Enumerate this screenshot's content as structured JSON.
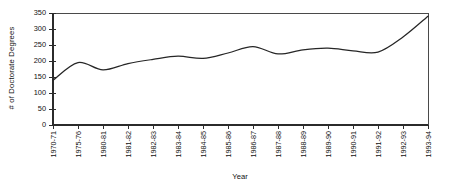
{
  "chart_data": {
    "type": "line",
    "title": "",
    "xlabel": "Year",
    "ylabel": "# of  Doctorate  Degrees",
    "categories": [
      "1970-71",
      "1975-76",
      "1980-81",
      "1981-82",
      "1982-83",
      "1983-84",
      "1984-85",
      "1985-86",
      "1986-87",
      "1987-88",
      "1988-89",
      "1989-90",
      "1990-91",
      "1991-92",
      "1992-93",
      "1993-94"
    ],
    "values": [
      140,
      195,
      172,
      192,
      205,
      215,
      208,
      225,
      245,
      222,
      235,
      240,
      232,
      228,
      275,
      340
    ],
    "series": [
      {
        "name": "# of Doctorate Degrees",
        "values": [
          140,
          195,
          172,
          192,
          205,
          215,
          208,
          225,
          245,
          222,
          235,
          240,
          232,
          228,
          275,
          340
        ]
      }
    ],
    "ylim": [
      0,
      350
    ],
    "yticks": [
      0,
      50,
      100,
      150,
      200,
      250,
      300,
      350
    ],
    "ytick_labels": [
      "0",
      "50",
      "100",
      "150",
      "200",
      "250",
      "300",
      "350"
    ],
    "grid": false,
    "legend": false,
    "legend_position": "none",
    "line_color": "#262626",
    "smoothing": "spline"
  }
}
